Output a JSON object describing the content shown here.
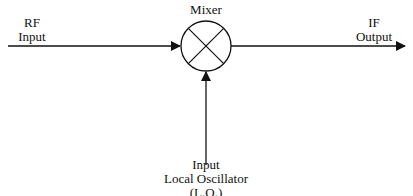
{
  "diagram": {
    "mixer": {
      "label": "Mixer",
      "symbol": "circle-with-x"
    },
    "rf_input": {
      "line1": "RF",
      "line2": "Input"
    },
    "if_output": {
      "line1": "IF",
      "line2": "Output"
    },
    "lo_input": {
      "line1": "Input",
      "line2": "Local Oscillator",
      "line3": "(L.O.)"
    },
    "colors": {
      "stroke": "#111111",
      "background": "#ffffff"
    }
  }
}
